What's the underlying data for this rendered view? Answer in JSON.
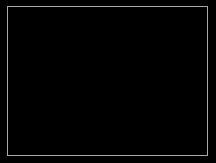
{
  "view": {
    "label": "astronomical-image-frame",
    "width": 216,
    "height": 163,
    "background_color": "#000000",
    "frame_color": "#a8a8a8",
    "frame_inset_px": 7,
    "frame_border_px": 1,
    "field_description": "Dark sky field with two bright unresolved point sources",
    "alt_text": "Black telescope image frame showing two white blurred point sources"
  },
  "sources": [
    {
      "name": "source-upper-right",
      "label": "",
      "center_x": 171,
      "center_y": 46,
      "core_radius_px": 6,
      "halo_radius_px": 17,
      "peak_color": "#ffffff",
      "relative_brightness": 100,
      "shape": "slightly-elongated-double-lobed"
    },
    {
      "name": "source-lower-left",
      "label": "",
      "center_x": 45,
      "center_y": 95,
      "core_radius_px": 4,
      "halo_radius_px": 12,
      "peak_color": "#ffffff",
      "relative_brightness": 82,
      "shape": "round-compact"
    }
  ]
}
